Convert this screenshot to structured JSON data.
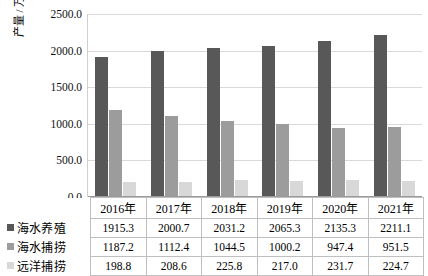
{
  "chart_data": {
    "type": "bar",
    "title": "",
    "xlabel": "",
    "ylabel": "产量 / 万吨",
    "ylim": [
      0,
      2500
    ],
    "ytick_labels": [
      "2500.0",
      "2000.0",
      "1500.0",
      "1000.0",
      "500.0",
      "0.0"
    ],
    "ytick_values": [
      2500,
      2000,
      1500,
      1000,
      500,
      0
    ],
    "grid": true,
    "legend_position": "table-left",
    "categories": [
      "2016年",
      "2017年",
      "2018年",
      "2019年",
      "2020年",
      "2021年"
    ],
    "series": [
      {
        "name": "海水养殖",
        "color": "#585858",
        "values": [
          1915.3,
          2000.7,
          2031.2,
          2065.3,
          2135.3,
          2211.1
        ],
        "labels": [
          "1915.3",
          "2000.7",
          "2031.2",
          "2065.3",
          "2135.3",
          "2211.1"
        ]
      },
      {
        "name": "海水捕捞",
        "color": "#9c9c9c",
        "values": [
          1187.2,
          1112.4,
          1044.5,
          1000.2,
          947.4,
          951.5
        ],
        "labels": [
          "1187.2",
          "1112.4",
          "1044.5",
          "1000.2",
          "947.4",
          "951.5"
        ]
      },
      {
        "name": "远洋捕捞",
        "color": "#d8d8d8",
        "values": [
          198.8,
          208.6,
          225.8,
          217.0,
          231.7,
          224.7
        ],
        "labels": [
          "198.8",
          "208.6",
          "225.8",
          "217.0",
          "231.7",
          "224.7"
        ]
      }
    ]
  },
  "colors": {
    "series_1": "#585858",
    "series_2": "#9c9c9c",
    "series_3": "#d8d8d8",
    "gridline": "#d9d9d9",
    "table_border": "#bfbfbf",
    "text": "#000000"
  }
}
